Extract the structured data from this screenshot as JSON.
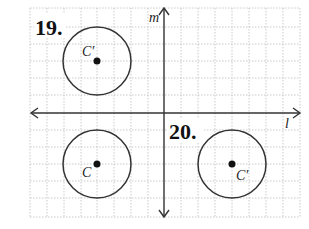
{
  "figure": {
    "type": "coordinate-grid-reflection-exercises",
    "grid": {
      "x_min": 30,
      "x_max": 300,
      "y_min": 8,
      "y_max": 217,
      "spacing": 17,
      "style": "dotted",
      "color": "#bbbbbb"
    },
    "axes": {
      "vertical": {
        "label": "m",
        "x": 164
      },
      "horizontal": {
        "label": "l",
        "y": 113
      }
    },
    "problems": [
      {
        "number": "19.",
        "circle": {
          "cx": 97,
          "cy": 61,
          "r": 34
        },
        "center_label": "C′",
        "note": "image above line l"
      },
      {
        "number": "",
        "circle": {
          "cx": 97,
          "cy": 164,
          "r": 34
        },
        "center_label": "C",
        "note": "original below line l"
      },
      {
        "number": "20.",
        "circle": {
          "cx": 232,
          "cy": 164,
          "r": 34
        },
        "center_label": "C′",
        "note": "image across line m"
      }
    ],
    "labels": {
      "problem_19": "19.",
      "problem_20": "20.",
      "axis_m": "m",
      "axis_l": "l",
      "c_prime_19": "C′",
      "c_original": "C",
      "c_prime_20": "C′"
    }
  }
}
